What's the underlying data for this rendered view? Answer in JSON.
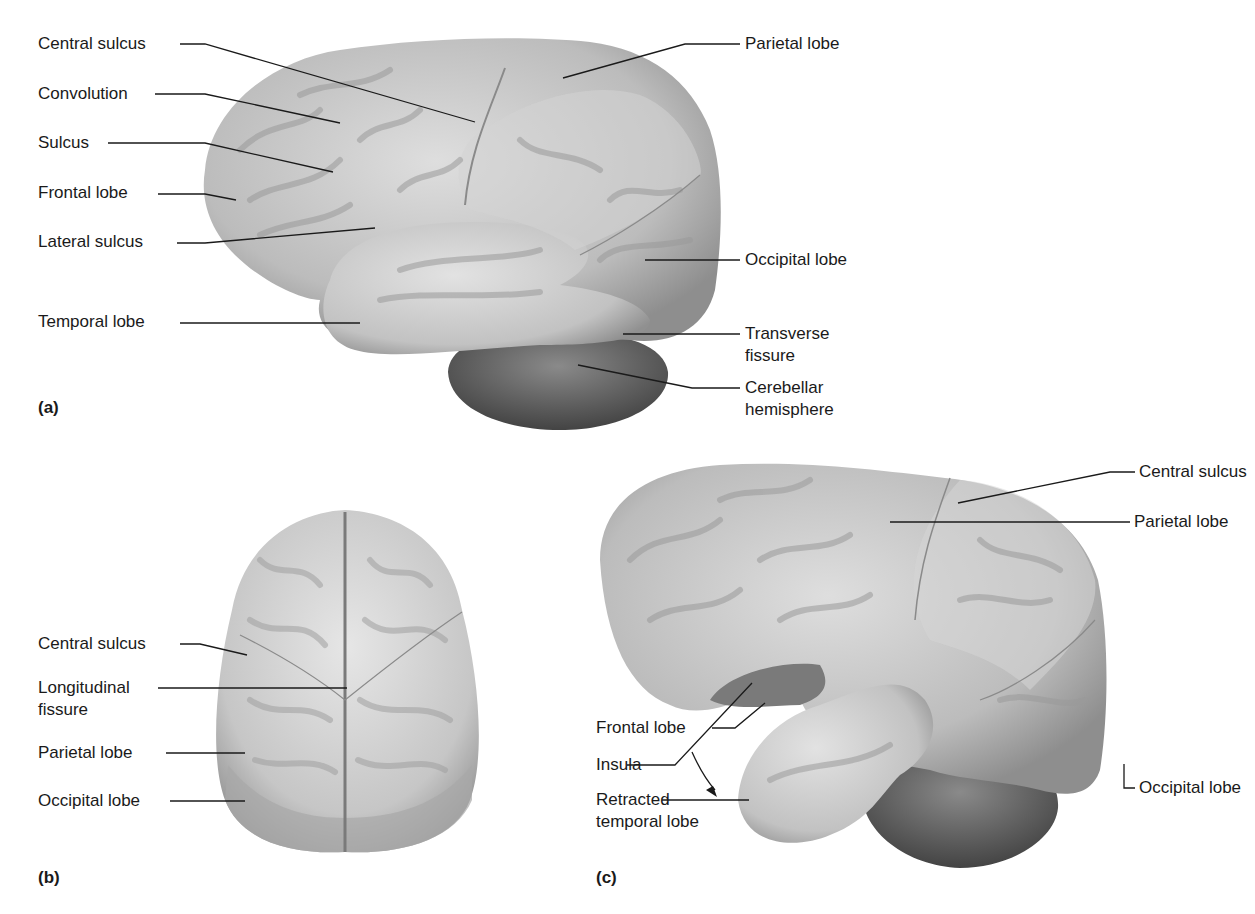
{
  "figure": {
    "panels": [
      {
        "id": "a",
        "letter": "(a)",
        "view": "lateral view",
        "labels": {
          "central_sulcus": "Central sulcus",
          "convolution": "Convolution",
          "sulcus": "Sulcus",
          "frontal_lobe": "Frontal lobe",
          "lateral_sulcus": "Lateral sulcus",
          "temporal_lobe": "Temporal lobe",
          "parietal_lobe": "Parietal lobe",
          "occipital_lobe": "Occipital lobe",
          "transverse_fissure_1": "Transverse",
          "transverse_fissure_2": "fissure",
          "cerebellar_hemisphere_1": "Cerebellar",
          "cerebellar_hemisphere_2": "hemisphere"
        }
      },
      {
        "id": "b",
        "letter": "(b)",
        "view": "superior view",
        "labels": {
          "central_sulcus": "Central sulcus",
          "longitudinal_fissure_1": "Longitudinal",
          "longitudinal_fissure_2": "fissure",
          "parietal_lobe": "Parietal lobe",
          "occipital_lobe": "Occipital lobe"
        }
      },
      {
        "id": "c",
        "letter": "(c)",
        "view": "lateral view, temporal lobe retracted",
        "labels": {
          "central_sulcus": "Central sulcus",
          "parietal_lobe": "Parietal lobe",
          "frontal_lobe": "Frontal lobe",
          "insula": "Insula",
          "retracted_temporal_lobe_1": "Retracted",
          "retracted_temporal_lobe_2": "temporal lobe",
          "occipital_lobe": "Occipital lobe"
        }
      }
    ],
    "colors": {
      "cortex": "#b9b9b9",
      "cortex_light": "#dcdcdc",
      "cortex_dark": "#8a8a8a",
      "cerebellum": "#5e5e5e",
      "leader": "#1a1a1a"
    }
  }
}
